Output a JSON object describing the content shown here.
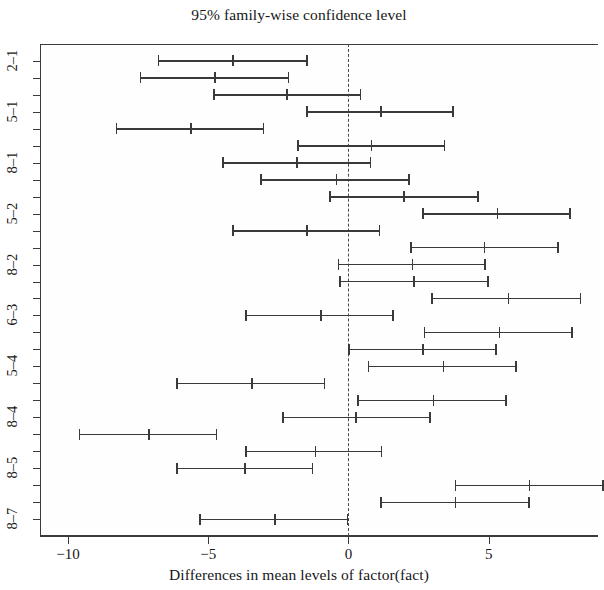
{
  "chart_data": {
    "type": "errorbar",
    "title": "95% family-wise confidence level",
    "xlabel": "Differences in mean levels of factor(fact)",
    "ylabel": "",
    "xlim": [
      -11.0,
      8.9
    ],
    "xticks": [
      -10,
      -5,
      0,
      5
    ],
    "xticklabels": [
      "−10",
      "−5",
      "0",
      "5"
    ],
    "grid": false,
    "legend": null,
    "reference_line": {
      "x": 0,
      "style": "dashed"
    },
    "ylabels_visible": [
      "2–1",
      "5–1",
      "8–1",
      "5–2",
      "8–2",
      "6–3",
      "5–4",
      "8–4",
      "8–5",
      "8–7"
    ],
    "comparisons": [
      {
        "label": "2-1",
        "lower": -6.79,
        "center": -4.14,
        "upper": -1.46,
        "tick_label": "2–1"
      },
      {
        "label": "3-1",
        "lower": -7.43,
        "center": -4.79,
        "upper": -2.11,
        "tick_label": ""
      },
      {
        "label": "4-1",
        "lower": -4.82,
        "center": -2.21,
        "upper": 0.46,
        "tick_label": ""
      },
      {
        "label": "5-1",
        "lower": -1.5,
        "center": 1.14,
        "upper": 3.75,
        "tick_label": "5–1"
      },
      {
        "label": "6-1",
        "lower": -8.29,
        "center": -5.64,
        "upper": -3.0,
        "tick_label": ""
      },
      {
        "label": "7-1",
        "lower": -1.82,
        "center": 0.79,
        "upper": 3.46,
        "tick_label": ""
      },
      {
        "label": "8-1",
        "lower": -4.5,
        "center": -1.86,
        "upper": 0.82,
        "tick_label": "8–1"
      },
      {
        "label": "3-2",
        "lower": -3.14,
        "center": -0.46,
        "upper": 2.18,
        "tick_label": ""
      },
      {
        "label": "4-2",
        "lower": -0.68,
        "center": 1.96,
        "upper": 4.64,
        "tick_label": ""
      },
      {
        "label": "5-2",
        "lower": 2.64,
        "center": 5.29,
        "upper": 7.93,
        "tick_label": "5–2"
      },
      {
        "label": "6-2",
        "lower": -4.14,
        "center": -1.5,
        "upper": 1.14,
        "tick_label": ""
      },
      {
        "label": "7-2",
        "lower": 2.21,
        "center": 4.82,
        "upper": 7.5,
        "tick_label": ""
      },
      {
        "label": "8-2",
        "lower": -0.39,
        "center": 2.25,
        "upper": 4.89,
        "tick_label": "8–2"
      },
      {
        "label": "4-3",
        "lower": -0.32,
        "center": 2.32,
        "upper": 5.0,
        "tick_label": ""
      },
      {
        "label": "5-3",
        "lower": 2.96,
        "center": 5.68,
        "upper": 8.29,
        "tick_label": ""
      },
      {
        "label": "6-3",
        "lower": -3.68,
        "center": -1.0,
        "upper": 1.61,
        "tick_label": "6–3"
      },
      {
        "label": "7-3",
        "lower": 2.68,
        "center": 5.36,
        "upper": 8.0,
        "tick_label": ""
      },
      {
        "label": "8-3",
        "lower": 0.0,
        "center": 2.64,
        "upper": 5.29,
        "tick_label": ""
      },
      {
        "label": "5-4",
        "lower": 0.68,
        "center": 3.36,
        "upper": 6.0,
        "tick_label": "5–4"
      },
      {
        "label": "6-4",
        "lower": -6.14,
        "center": -3.46,
        "upper": -0.82,
        "tick_label": ""
      },
      {
        "label": "7-4",
        "lower": 0.32,
        "center": 3.0,
        "upper": 5.64,
        "tick_label": ""
      },
      {
        "label": "8-4",
        "lower": -2.36,
        "center": 0.25,
        "upper": 2.93,
        "tick_label": "8–4"
      },
      {
        "label": "6-5",
        "lower": -9.61,
        "center": -7.14,
        "upper": -4.68,
        "tick_label": ""
      },
      {
        "label": "7-5",
        "lower": -3.68,
        "center": -1.21,
        "upper": 1.21,
        "tick_label": ""
      },
      {
        "label": "8-5",
        "lower": -6.14,
        "center": -3.71,
        "upper": -1.25,
        "tick_label": "8–5"
      },
      {
        "label": "7-6",
        "lower": 3.79,
        "center": 6.43,
        "upper": 9.11,
        "tick_label": ""
      },
      {
        "label": "8-6",
        "lower": 1.14,
        "center": 3.79,
        "upper": 6.46,
        "tick_label": ""
      },
      {
        "label": "8-7",
        "lower": -5.32,
        "center": -2.64,
        "upper": 0.0,
        "tick_label": "8–7"
      }
    ]
  },
  "colors": {
    "line": "#3a3a3a",
    "axis": "#3b3b3b",
    "reference": "#4a4a4a",
    "background": "#ffffff"
  }
}
